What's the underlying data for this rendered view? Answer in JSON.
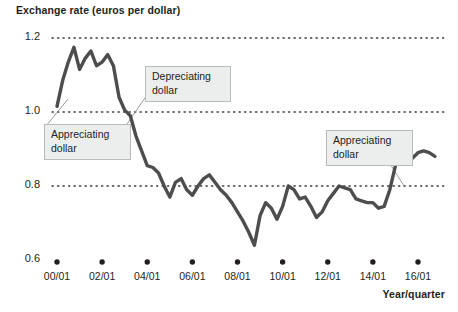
{
  "chart_data": {
    "type": "line",
    "title": "Exchange rate (euros per dollar)",
    "xlabel": "Year/quarter",
    "ylabel": "Exchange rate (euros per dollar)",
    "ylim": [
      0.6,
      1.2
    ],
    "grid": true,
    "grid_style": "dotted-horizontal",
    "legend": "none",
    "line_color": "#4d4d4d",
    "y_ticks": [
      "1.2",
      "1.0",
      "0.8",
      "0.6"
    ],
    "y_tick_values": [
      1.2,
      1.0,
      0.8,
      0.6
    ],
    "x_ticks": [
      "00/01",
      "02/01",
      "04/01",
      "06/01",
      "08/01",
      "10/01",
      "12/01",
      "14/01",
      "16/01"
    ],
    "x_tick_values": [
      2000.0,
      2002.0,
      2004.0,
      2006.0,
      2008.0,
      2010.0,
      2012.0,
      2014.0,
      2016.0
    ],
    "x": [
      2000.0,
      2000.25,
      2000.5,
      2000.75,
      2001.0,
      2001.25,
      2001.5,
      2001.75,
      2002.0,
      2002.25,
      2002.5,
      2002.75,
      2003.0,
      2003.25,
      2003.5,
      2003.75,
      2004.0,
      2004.25,
      2004.5,
      2004.75,
      2005.0,
      2005.25,
      2005.5,
      2005.75,
      2006.0,
      2006.25,
      2006.5,
      2006.75,
      2007.0,
      2007.25,
      2007.5,
      2007.75,
      2008.0,
      2008.25,
      2008.5,
      2008.75,
      2009.0,
      2009.25,
      2009.5,
      2009.75,
      2010.0,
      2010.25,
      2010.5,
      2010.75,
      2011.0,
      2011.25,
      2011.5,
      2011.75,
      2012.0,
      2012.25,
      2012.5,
      2012.75,
      2013.0,
      2013.25,
      2013.5,
      2013.75,
      2014.0,
      2014.25,
      2014.5,
      2014.75,
      2015.0,
      2015.25,
      2015.5,
      2015.75,
      2016.0,
      2016.25,
      2016.5,
      2016.75
    ],
    "values": [
      1.015,
      1.085,
      1.135,
      1.175,
      1.115,
      1.145,
      1.165,
      1.125,
      1.135,
      1.155,
      1.125,
      1.04,
      1.005,
      0.99,
      0.935,
      0.895,
      0.855,
      0.85,
      0.835,
      0.8,
      0.77,
      0.81,
      0.82,
      0.79,
      0.775,
      0.8,
      0.82,
      0.83,
      0.81,
      0.79,
      0.775,
      0.755,
      0.73,
      0.705,
      0.675,
      0.64,
      0.72,
      0.755,
      0.74,
      0.71,
      0.745,
      0.8,
      0.79,
      0.765,
      0.77,
      0.745,
      0.715,
      0.73,
      0.76,
      0.78,
      0.8,
      0.795,
      0.79,
      0.765,
      0.76,
      0.755,
      0.755,
      0.74,
      0.745,
      0.79,
      0.855,
      0.88,
      0.885,
      0.875,
      0.89,
      0.895,
      0.89,
      0.88
    ],
    "annotations": [
      {
        "id": "appreciating-dollar-early",
        "line1": "Appreciating",
        "line2": "dollar",
        "box": {
          "left": 44,
          "top": 124,
          "width": 73,
          "height": 29
        },
        "leader": {
          "x1": 46,
          "y1": 126,
          "x2": 68,
          "y2": 99
        }
      },
      {
        "id": "depreciating-dollar",
        "line1": "Depreciating",
        "line2": "dollar",
        "box": {
          "left": 145,
          "top": 66,
          "width": 72,
          "height": 29
        },
        "leader": {
          "x1": 147,
          "y1": 95,
          "x2": 127,
          "y2": 124
        }
      },
      {
        "id": "appreciating-dollar-late",
        "line1": "Appreciating",
        "line2": "dollar",
        "box": {
          "left": 326,
          "top": 130,
          "width": 73,
          "height": 29
        },
        "leader": {
          "x1": 387,
          "y1": 159,
          "x2": 404,
          "y2": 186
        }
      }
    ]
  }
}
